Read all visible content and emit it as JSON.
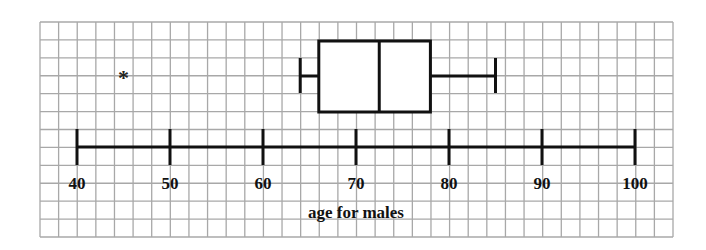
{
  "chart_data": {
    "type": "boxplot",
    "title": "",
    "xlabel": "age for males",
    "ylabel": "",
    "xlim": [
      40,
      100
    ],
    "x_ticks": [
      40,
      50,
      60,
      70,
      80,
      90,
      100
    ],
    "tick_labels": [
      "40",
      "50",
      "60",
      "70",
      "80",
      "90",
      "100"
    ],
    "grid": true,
    "series": [
      {
        "name": "males",
        "min": 64,
        "q1": 66,
        "median": 72.5,
        "q3": 78,
        "max": 85,
        "outliers": [
          45
        ]
      }
    ]
  },
  "style": {
    "grid_color": "#a8a8a8",
    "stroke_color": "#111111",
    "outlier_symbol": "*"
  }
}
